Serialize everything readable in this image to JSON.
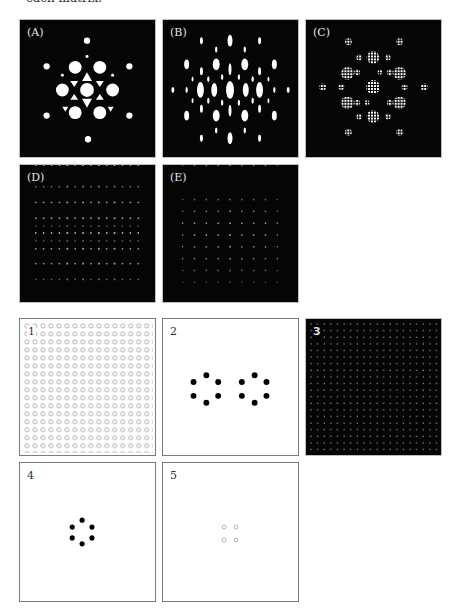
{
  "page": {
    "caption_fragment": "each matrix."
  },
  "figure": {
    "top_panels": [
      {
        "id": "A",
        "label": "(A)",
        "description": "hexagonal diffraction pattern with large bright discs and triangular spots"
      },
      {
        "id": "B",
        "label": "(B)",
        "description": "diffraction pattern of elongated vertical ellipses"
      },
      {
        "id": "C",
        "label": "(C)",
        "description": "diffraction pattern of grid-textured discs in hexagonal arrangement"
      },
      {
        "id": "D",
        "label": "(D)",
        "description": "faint diffraction pattern of fine dot rows"
      },
      {
        "id": "E",
        "label": "(E)",
        "description": "faint square grid of dots"
      }
    ],
    "bottom_panels": [
      {
        "id": "1",
        "label": "1",
        "description": "dense square array of small open circles"
      },
      {
        "id": "2",
        "label": "2",
        "description": "two hexagonal rings of six black dots"
      },
      {
        "id": "3",
        "label": "3",
        "description": "dark field with fine square grid of gray dots"
      },
      {
        "id": "4",
        "label": "4",
        "description": "single hexagonal ring of six black dots"
      },
      {
        "id": "5",
        "label": "5",
        "description": "four small open gray circles in a square"
      }
    ]
  },
  "colors": {
    "dark_bg": "#050505",
    "spot": "#ffffff",
    "dot": "#000000",
    "open_circle": "#9a9a9a"
  }
}
